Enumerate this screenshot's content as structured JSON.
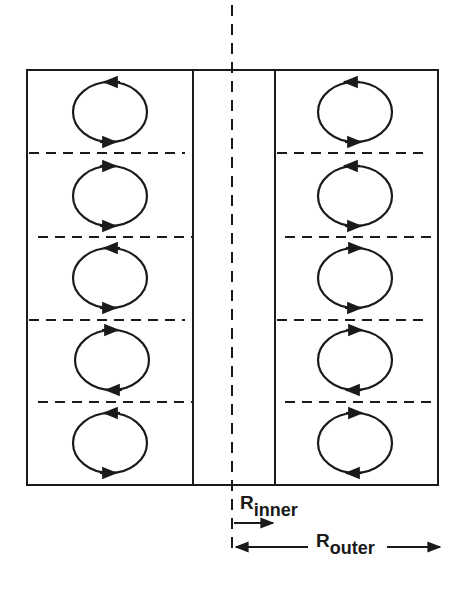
{
  "diagram": {
    "colors": {
      "line": "#1a1a1a",
      "background": "#ffffff"
    },
    "left_cells": 5,
    "right_cells": 5,
    "labels": {
      "r_inner": {
        "main": "R",
        "sub": "inner"
      },
      "r_outer": {
        "main": "R",
        "sub": "outer"
      }
    },
    "axis": "center-axis-dashed"
  }
}
